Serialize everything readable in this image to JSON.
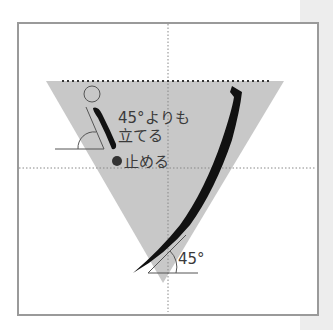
{
  "diagram": {
    "title": "",
    "annotations": {
      "upper_note_line1": "45°よりも",
      "upper_note_line2": "立てる",
      "stop_note": "止める",
      "bottom_angle": "45°"
    },
    "colors": {
      "triangle_fill": "#c8c8c8",
      "stroke": "#111111",
      "frame_border": "#9a9a9a",
      "guide_dots": "#888888",
      "side_strip": "#ededed",
      "stop_dot": "#333333"
    },
    "icons": {
      "start_point": "open-circle",
      "stop_point": "filled-circle",
      "angle_marks": "arc-angle"
    }
  }
}
